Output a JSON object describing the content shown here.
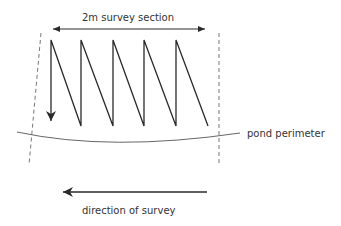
{
  "diagram": {
    "title_label": "2m survey section",
    "perimeter_label": "pond perimeter",
    "direction_label": "direction of survey",
    "colors": {
      "stroke": "#2a2a2a",
      "dashed": "#777777",
      "text": "#333333"
    }
  }
}
